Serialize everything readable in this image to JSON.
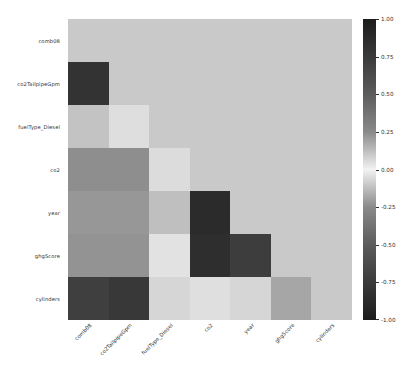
{
  "chart_data": {
    "type": "heatmap",
    "title": "",
    "xlabel": "",
    "ylabel": "",
    "masked": "upper-triangle-and-diagonal",
    "mask_color": "#c9c9c9",
    "colormap": "diverging-grayscale",
    "grid": false,
    "legend_position": "right-colorbar",
    "zlim": [
      -1.0,
      1.0
    ],
    "colorbar": {
      "ticks": [
        "1.00",
        "0.75",
        "0.50",
        "0.25",
        "0.00",
        "-0.25",
        "-0.50",
        "-0.75",
        "-1.00"
      ],
      "values": [
        1.0,
        0.75,
        0.5,
        0.25,
        0.0,
        -0.25,
        -0.5,
        -0.75,
        -1.0
      ]
    },
    "categories": [
      "comb08",
      "co2TailpipeGpm",
      "fuelType_Diesel",
      "co2",
      "year",
      "ghgScore",
      "cylinders"
    ],
    "rows": [
      {
        "label": "comb08",
        "cells": [
          {
            "col": "comb08",
            "value": null,
            "color": "#c9c9c9",
            "masked": true
          },
          {
            "col": "co2TailpipeGpm",
            "value": null,
            "color": "#c9c9c9",
            "masked": true
          },
          {
            "col": "fuelType_Diesel",
            "value": null,
            "color": "#c9c9c9",
            "masked": true
          },
          {
            "col": "co2",
            "value": null,
            "color": "#c9c9c9",
            "masked": true
          },
          {
            "col": "year",
            "value": null,
            "color": "#c9c9c9",
            "masked": true
          },
          {
            "col": "ghgScore",
            "value": null,
            "color": "#c9c9c9",
            "masked": true
          },
          {
            "col": "cylinders",
            "value": null,
            "color": "#c9c9c9",
            "masked": true
          }
        ]
      },
      {
        "label": "co2TailpipeGpm",
        "cells": [
          {
            "col": "comb08",
            "value": -0.9,
            "color": "#333333",
            "masked": false
          },
          {
            "col": "co2TailpipeGpm",
            "value": null,
            "color": "#c9c9c9",
            "masked": true
          },
          {
            "col": "fuelType_Diesel",
            "value": null,
            "color": "#c9c9c9",
            "masked": true
          },
          {
            "col": "co2",
            "value": null,
            "color": "#c9c9c9",
            "masked": true
          },
          {
            "col": "year",
            "value": null,
            "color": "#c9c9c9",
            "masked": true
          },
          {
            "col": "ghgScore",
            "value": null,
            "color": "#c9c9c9",
            "masked": true
          },
          {
            "col": "cylinders",
            "value": null,
            "color": "#c9c9c9",
            "masked": true
          }
        ]
      },
      {
        "label": "fuelType_Diesel",
        "cells": [
          {
            "col": "comb08",
            "value": 0.12,
            "color": "#c3c3c3",
            "masked": false
          },
          {
            "col": "co2TailpipeGpm",
            "value": 0.25,
            "color": "#dedede",
            "masked": false
          },
          {
            "col": "fuelType_Diesel",
            "value": null,
            "color": "#c9c9c9",
            "masked": true
          },
          {
            "col": "co2",
            "value": null,
            "color": "#c9c9c9",
            "masked": true
          },
          {
            "col": "year",
            "value": null,
            "color": "#c9c9c9",
            "masked": true
          },
          {
            "col": "ghgScore",
            "value": null,
            "color": "#c9c9c9",
            "masked": true
          },
          {
            "col": "cylinders",
            "value": null,
            "color": "#c9c9c9",
            "masked": true
          }
        ]
      },
      {
        "label": "co2",
        "cells": [
          {
            "col": "comb08",
            "value": -0.55,
            "color": "#8e8e8e",
            "masked": false
          },
          {
            "col": "co2TailpipeGpm",
            "value": -0.55,
            "color": "#8e8e8e",
            "masked": false
          },
          {
            "col": "fuelType_Diesel",
            "value": 0.22,
            "color": "#dcdcdc",
            "masked": false
          },
          {
            "col": "co2",
            "value": null,
            "color": "#c9c9c9",
            "masked": true
          },
          {
            "col": "year",
            "value": null,
            "color": "#c9c9c9",
            "masked": true
          },
          {
            "col": "ghgScore",
            "value": null,
            "color": "#c9c9c9",
            "masked": true
          },
          {
            "col": "cylinders",
            "value": null,
            "color": "#c9c9c9",
            "masked": true
          }
        ]
      },
      {
        "label": "year",
        "cells": [
          {
            "col": "comb08",
            "value": -0.45,
            "color": "#979797",
            "masked": false
          },
          {
            "col": "co2TailpipeGpm",
            "value": -0.45,
            "color": "#979797",
            "masked": false
          },
          {
            "col": "fuelType_Diesel",
            "value": 0.08,
            "color": "#bfbfbf",
            "masked": false
          },
          {
            "col": "co2",
            "value": -0.95,
            "color": "#2b2b2b",
            "masked": false
          },
          {
            "col": "year",
            "value": null,
            "color": "#c9c9c9",
            "masked": true
          },
          {
            "col": "ghgScore",
            "value": null,
            "color": "#c9c9c9",
            "masked": true
          },
          {
            "col": "cylinders",
            "value": null,
            "color": "#c9c9c9",
            "masked": true
          }
        ]
      },
      {
        "label": "ghgScore",
        "cells": [
          {
            "col": "comb08",
            "value": -0.5,
            "color": "#939393",
            "masked": false
          },
          {
            "col": "co2TailpipeGpm",
            "value": -0.5,
            "color": "#939393",
            "masked": false
          },
          {
            "col": "fuelType_Diesel",
            "value": 0.28,
            "color": "#e2e2e2",
            "masked": false
          },
          {
            "col": "co2",
            "value": -0.93,
            "color": "#2e2e2e",
            "masked": false
          },
          {
            "col": "year",
            "value": -0.8,
            "color": "#3d3d3d",
            "masked": false
          },
          {
            "col": "ghgScore",
            "value": null,
            "color": "#c9c9c9",
            "masked": true
          },
          {
            "col": "cylinders",
            "value": null,
            "color": "#c9c9c9",
            "masked": true
          }
        ]
      },
      {
        "label": "cylinders",
        "cells": [
          {
            "col": "comb08",
            "value": -0.8,
            "color": "#3f3f3f",
            "masked": false
          },
          {
            "col": "co2TailpipeGpm",
            "value": -0.85,
            "color": "#383838",
            "masked": false
          },
          {
            "col": "fuelType_Diesel",
            "value": 0.2,
            "color": "#d6d6d6",
            "masked": false
          },
          {
            "col": "co2",
            "value": 0.26,
            "color": "#dfdfdf",
            "masked": false
          },
          {
            "col": "year",
            "value": 0.2,
            "color": "#d6d6d6",
            "masked": false
          },
          {
            "col": "ghgScore",
            "value": -0.35,
            "color": "#a6a6a6",
            "masked": false
          },
          {
            "col": "cylinders",
            "value": null,
            "color": "#c9c9c9",
            "masked": true
          }
        ]
      }
    ]
  }
}
